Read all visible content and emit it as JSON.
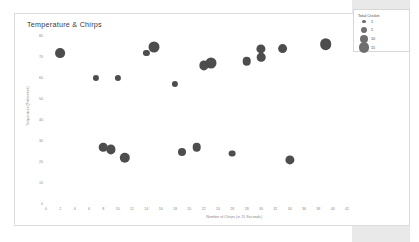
{
  "panel": {
    "background_color": "#e9e9e9"
  },
  "chart_card": {
    "border_color": "#dcdcdc",
    "background_color": "#ffffff"
  },
  "legend": {
    "title": "Total Cricket",
    "items": [
      {
        "label": "1",
        "size": 1.7
      },
      {
        "label": "5",
        "size": 3.0
      },
      {
        "label": "10",
        "size": 4.4
      },
      {
        "label": "15",
        "size": 5.4
      }
    ]
  },
  "chart_data": {
    "type": "scatter",
    "title": "Temperature & Chirps",
    "xlabel": "Number of Chirps (in 15 Seconds)",
    "ylabel": "Temperature (Fahrenheit)",
    "xlim": [
      0,
      42
    ],
    "ylim": [
      0,
      80
    ],
    "xticks": [
      0,
      2,
      4,
      6,
      8,
      10,
      12,
      14,
      16,
      18,
      20,
      22,
      24,
      26,
      28,
      30,
      32,
      34,
      36,
      38,
      40,
      42
    ],
    "yticks": [
      0,
      10,
      20,
      30,
      40,
      50,
      60,
      70,
      80
    ],
    "grid": false,
    "legend_position": "right",
    "marker_color": "#4d4d4d",
    "size_legend_title": "Total Cricket",
    "points": [
      {
        "x": 2,
        "y": 72,
        "size": 11
      },
      {
        "x": 7,
        "y": 60,
        "size": 5
      },
      {
        "x": 8,
        "y": 27,
        "size": 9
      },
      {
        "x": 9,
        "y": 26,
        "size": 10
      },
      {
        "x": 10,
        "y": 60,
        "size": 5
      },
      {
        "x": 11,
        "y": 22,
        "size": 12
      },
      {
        "x": 14,
        "y": 72,
        "size": 5
      },
      {
        "x": 15,
        "y": 75,
        "size": 13
      },
      {
        "x": 18,
        "y": 57,
        "size": 5
      },
      {
        "x": 19,
        "y": 25,
        "size": 8
      },
      {
        "x": 21,
        "y": 27,
        "size": 9
      },
      {
        "x": 22,
        "y": 66,
        "size": 10
      },
      {
        "x": 23,
        "y": 67,
        "size": 13
      },
      {
        "x": 26,
        "y": 24,
        "size": 6
      },
      {
        "x": 28,
        "y": 68,
        "size": 9
      },
      {
        "x": 30,
        "y": 74,
        "size": 10
      },
      {
        "x": 30,
        "y": 70,
        "size": 9
      },
      {
        "x": 33,
        "y": 74,
        "size": 11
      },
      {
        "x": 34,
        "y": 21,
        "size": 10
      },
      {
        "x": 39,
        "y": 76,
        "size": 14
      }
    ]
  }
}
